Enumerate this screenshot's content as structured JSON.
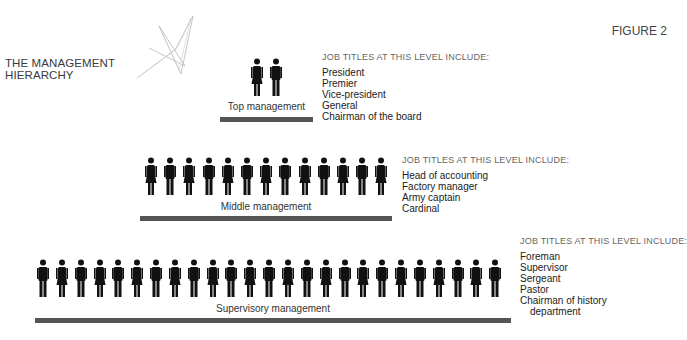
{
  "header": {
    "title_line1": "THE MANAGEMENT",
    "title_line2": "HIERARCHY",
    "figure_label": "FIGURE 2"
  },
  "levels": {
    "top": {
      "label": "Top management",
      "people": [
        "F",
        "M"
      ],
      "titles_header": "JOB TITLES AT THIS LEVEL INCLUDE:",
      "titles": [
        "President",
        "Premier",
        "Vice-president",
        "General",
        "Chairman of the board"
      ]
    },
    "middle": {
      "label": "Middle management",
      "people": [
        "F",
        "M",
        "F",
        "M",
        "F",
        "M",
        "F",
        "M",
        "F",
        "M",
        "F",
        "M",
        "F"
      ],
      "titles_header": "JOB TITLES AT THIS LEVEL INCLUDE:",
      "titles": [
        "Head of accounting",
        "Factory manager",
        "Army captain",
        "Cardinal"
      ]
    },
    "supervisory": {
      "label": "Supervisory management",
      "people": [
        "M",
        "F",
        "M",
        "F",
        "M",
        "F",
        "M",
        "F",
        "M",
        "F",
        "M",
        "F",
        "M",
        "F",
        "M",
        "F",
        "M",
        "F",
        "M",
        "F",
        "M",
        "F",
        "M",
        "F",
        "M"
      ],
      "titles_header": "JOB TITLES AT THIS LEVEL INCLUDE:",
      "titles": [
        "Foreman",
        "Supervisor",
        "Sergeant",
        "Pastor",
        "Chairman of history",
        "department"
      ]
    }
  },
  "colors": {
    "figure": "#111111",
    "bar": "#555555"
  }
}
